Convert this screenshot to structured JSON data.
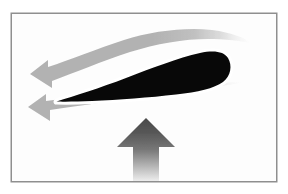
{
  "figure": {
    "title": "Airfoil lift diagram",
    "background_color": "#ffffff",
    "canvas": {
      "width": 288,
      "height": 194
    }
  },
  "frame": {
    "name": "image-border",
    "x": 11,
    "y": 13,
    "width": 266,
    "height": 169,
    "border_color": "#8f8f8f",
    "border_width": 1.5,
    "fill_color": "#ffffff",
    "inner_fill_color": "#fdfdfd"
  },
  "airfoil": {
    "name": "airfoil-cross-section",
    "label": "Airfoil",
    "fill_color": "#080808",
    "leading_edge": {
      "side": "right",
      "x": 229,
      "y": 68,
      "shape": "rounded"
    },
    "trailing_edge": {
      "side": "left",
      "x": 56,
      "y": 101,
      "shape": "sharp-point"
    },
    "chord_length_px": 173,
    "max_thickness_px": 34,
    "angle_of_attack_deg": 10,
    "path": "M 56.5 101.5 C 74 96 100 88 126 78 C 152 68 178 58 200 53 C 214 50 224 51.5 228 58 C 232.5 65.5 231 76 223 82 C 214 88.5 198 92 176 94.5 C 150 97.5 118 100 92 101 C 78 101.6 64 101.8 56.5 101.5 Z"
  },
  "flow_arrows": [
    {
      "name": "upper-flow-arrow",
      "label": "Upper surface airflow",
      "direction": "left",
      "color": "#b2b2b2",
      "tip": {
        "x": 30,
        "y": 74
      },
      "fades_right": true,
      "description": "Curved streamband flowing over the upper surface, accelerating and leaving to the left"
    },
    {
      "name": "lower-flow-arrow",
      "label": "Lower surface airflow",
      "direction": "left",
      "color": "#b2b2b2",
      "tip": {
        "x": 28,
        "y": 107
      },
      "fades_right": true,
      "description": "Straighter streamband flowing under the lower surface and leaving to the left"
    }
  ],
  "lift_arrow": {
    "name": "lift-force-arrow",
    "label": "Lift",
    "direction": "up",
    "tip": {
      "x": 146,
      "y": 118
    },
    "base": {
      "x": 146,
      "y": 181
    },
    "head_width_px": 58,
    "shaft_width_px": 26,
    "gradient": {
      "top_color": "#4d4d4d",
      "bottom_color": "#e8e8e8"
    }
  },
  "palette": {
    "airfoil_black": "#080808",
    "flow_gray": "#b2b2b2",
    "lift_dark": "#4d4d4d",
    "lift_light": "#e8e8e8",
    "border_gray": "#8f8f8f",
    "white": "#ffffff"
  }
}
